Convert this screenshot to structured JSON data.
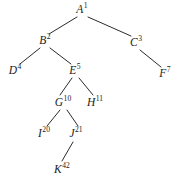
{
  "diagram": {
    "type": "tree",
    "background_color": "#ffffff",
    "stroke_color": "#2b2b2b",
    "text_color": "#1c1c1c",
    "nodes": [
      {
        "id": "A",
        "letter": "A",
        "index": "1",
        "x": 82,
        "y": 10
      },
      {
        "id": "B",
        "letter": "B",
        "index": "2",
        "x": 45,
        "y": 41
      },
      {
        "id": "C",
        "letter": "C",
        "index": "3",
        "x": 136,
        "y": 43
      },
      {
        "id": "D",
        "letter": "D",
        "index": "4",
        "x": 15,
        "y": 71
      },
      {
        "id": "E",
        "letter": "E",
        "index": "5",
        "x": 75,
        "y": 71
      },
      {
        "id": "F",
        "letter": "F",
        "index": "7",
        "x": 165,
        "y": 74
      },
      {
        "id": "G",
        "letter": "G",
        "index": "10",
        "x": 63,
        "y": 103
      },
      {
        "id": "H",
        "letter": "H",
        "index": "11",
        "x": 95,
        "y": 103
      },
      {
        "id": "I",
        "letter": "I",
        "index": "20",
        "x": 44,
        "y": 134
      },
      {
        "id": "J",
        "letter": "J",
        "index": "21",
        "x": 76,
        "y": 134
      },
      {
        "id": "K",
        "letter": "K",
        "index": "42",
        "x": 62,
        "y": 170
      }
    ],
    "edges": [
      {
        "from": "A",
        "to": "B",
        "x1": 77,
        "y1": 17,
        "x2": 49,
        "y2": 34
      },
      {
        "from": "A",
        "to": "C",
        "x1": 88,
        "y1": 17,
        "x2": 131,
        "y2": 36
      },
      {
        "from": "B",
        "to": "D",
        "x1": 40,
        "y1": 48,
        "x2": 20,
        "y2": 64
      },
      {
        "from": "B",
        "to": "E",
        "x1": 50,
        "y1": 48,
        "x2": 71,
        "y2": 64
      },
      {
        "from": "C",
        "to": "F",
        "x1": 140,
        "y1": 50,
        "x2": 161,
        "y2": 67
      },
      {
        "from": "E",
        "to": "G",
        "x1": 72,
        "y1": 78,
        "x2": 60,
        "y2": 95
      },
      {
        "from": "E",
        "to": "H",
        "x1": 79,
        "y1": 78,
        "x2": 93,
        "y2": 95
      },
      {
        "from": "G",
        "to": "I",
        "x1": 60,
        "y1": 110,
        "x2": 47,
        "y2": 126
      },
      {
        "from": "G",
        "to": "J",
        "x1": 67,
        "y1": 110,
        "x2": 78,
        "y2": 126
      },
      {
        "from": "J",
        "to": "K",
        "x1": 73,
        "y1": 142,
        "x2": 62,
        "y2": 161
      }
    ]
  }
}
